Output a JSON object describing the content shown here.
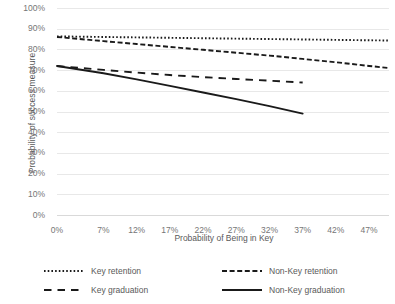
{
  "chart_data": {
    "type": "line",
    "title": "",
    "xlabel": "Probability of Being in Key",
    "ylabel": "Probability of success measure",
    "xlim": [
      0,
      50
    ],
    "ylim": [
      0,
      100
    ],
    "grid": true,
    "legend_position": "bottom",
    "x_tick_labels": [
      "0%",
      "7%",
      "12%",
      "17%",
      "22%",
      "27%",
      "32%",
      "37%",
      "42%",
      "47%"
    ],
    "x_tick_values": [
      0,
      7,
      12,
      17,
      22,
      27,
      32,
      37,
      42,
      47
    ],
    "y_tick_labels": [
      "0%",
      "10%",
      "20%",
      "30%",
      "40%",
      "50%",
      "60%",
      "70%",
      "80%",
      "90%",
      "100%"
    ],
    "y_tick_values": [
      0,
      10,
      20,
      30,
      40,
      50,
      60,
      70,
      80,
      90,
      100
    ],
    "series": [
      {
        "name": "Key retention",
        "style": "dotted",
        "color": "#1a1a1a",
        "x": [
          0,
          7,
          12,
          17,
          22,
          27,
          32,
          37,
          42,
          47,
          50
        ],
        "values": [
          86.3,
          86.0,
          85.8,
          85.6,
          85.4,
          85.2,
          85.0,
          84.8,
          84.6,
          84.4,
          84.3
        ]
      },
      {
        "name": "Non-Key retention",
        "style": "dashed",
        "color": "#1a1a1a",
        "x": [
          0,
          7,
          12,
          17,
          22,
          27,
          32,
          37,
          42,
          47,
          50
        ],
        "values": [
          86.0,
          84.0,
          82.6,
          81.2,
          79.8,
          78.4,
          77.0,
          75.4,
          73.8,
          72.0,
          71.0
        ]
      },
      {
        "name": "Key graduation",
        "style": "dashed-long",
        "color": "#1a1a1a",
        "x": [
          0,
          7,
          12,
          17,
          22,
          27,
          32,
          37
        ],
        "values": [
          72.0,
          70.1,
          68.8,
          67.6,
          66.6,
          65.7,
          64.9,
          64.0
        ]
      },
      {
        "name": "Non-Key graduation",
        "style": "solid",
        "color": "#1a1a1a",
        "x": [
          0,
          7,
          12,
          17,
          22,
          27,
          32,
          37
        ],
        "values": [
          72.0,
          68.5,
          65.5,
          62.4,
          59.2,
          56.0,
          52.6,
          49.0
        ]
      }
    ]
  },
  "legend": {
    "items": [
      {
        "label": "Key retention",
        "style": "dotted"
      },
      {
        "label": "Non-Key retention",
        "style": "dashed"
      },
      {
        "label": "Key graduation",
        "style": "dashed-long"
      },
      {
        "label": "Non-Key graduation",
        "style": "solid"
      }
    ]
  }
}
